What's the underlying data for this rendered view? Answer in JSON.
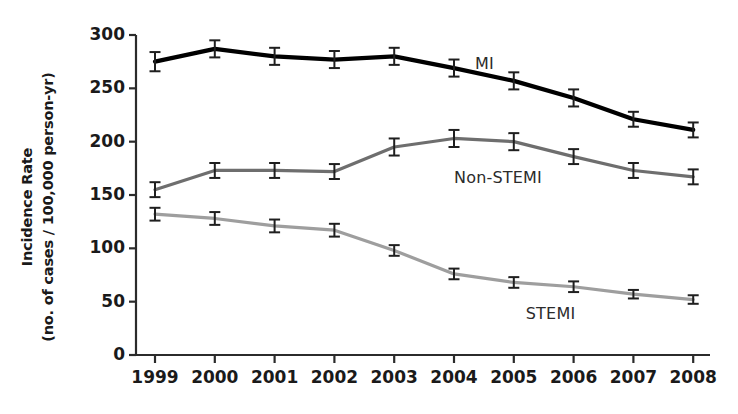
{
  "chart_data": {
    "type": "line",
    "title": "",
    "xlabel": "",
    "ylabel_line1": "Incidence Rate",
    "ylabel_line2": "(no. of cases / 100,000 person-yr)",
    "categories": [
      "1999",
      "2000",
      "2001",
      "2002",
      "2003",
      "2004",
      "2005",
      "2006",
      "2007",
      "2008"
    ],
    "x": [
      1999,
      2000,
      2001,
      2002,
      2003,
      2004,
      2005,
      2006,
      2007,
      2008
    ],
    "ylim": [
      0,
      300
    ],
    "yticks": [
      "0",
      "50",
      "100",
      "150",
      "200",
      "250",
      "300"
    ],
    "ytick_values": [
      0,
      50,
      100,
      150,
      200,
      250,
      300
    ],
    "grid": false,
    "legend_position": "inline-annotations",
    "error_bars": true,
    "series": [
      {
        "name": "MI",
        "color": "#000000",
        "line_width": 4.2,
        "values": [
          275,
          287,
          280,
          277,
          280,
          269,
          257,
          241,
          221,
          211
        ],
        "err_low": [
          266,
          279,
          272,
          269,
          272,
          261,
          249,
          233,
          214,
          204
        ],
        "err_high": [
          284,
          295,
          288,
          285,
          288,
          277,
          265,
          249,
          228,
          218
        ],
        "label": "MI",
        "label_x": 2004.35,
        "label_y": 273
      },
      {
        "name": "Non-STEMI",
        "color": "#6e6e6e",
        "line_width": 3.2,
        "values": [
          155,
          173,
          173,
          172,
          195,
          203,
          200,
          186,
          173,
          167
        ],
        "err_low": [
          148,
          166,
          166,
          165,
          187,
          195,
          192,
          179,
          166,
          160
        ],
        "err_high": [
          162,
          180,
          180,
          179,
          203,
          211,
          208,
          193,
          180,
          174
        ],
        "label": "Non-STEMI",
        "label_x": 2004.0,
        "label_y": 166
      },
      {
        "name": "STEMI",
        "color": "#9e9e9e",
        "line_width": 3.2,
        "values": [
          132,
          128,
          121,
          117,
          98,
          76,
          68,
          64,
          57,
          52
        ],
        "err_low": [
          126,
          122,
          115,
          111,
          93,
          71,
          63,
          59,
          53,
          48
        ],
        "err_high": [
          138,
          134,
          127,
          123,
          103,
          81,
          73,
          69,
          61,
          56
        ],
        "label": "STEMI",
        "label_x": 2005.2,
        "label_y": 38
      }
    ]
  },
  "axes": {
    "y_axis_name": "incidence-rate-axis",
    "x_axis_name": "year-axis"
  }
}
